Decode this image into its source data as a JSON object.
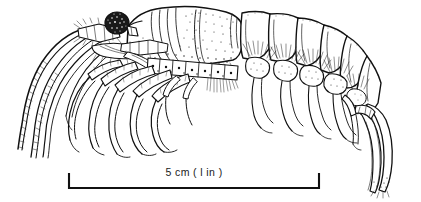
{
  "figure": {
    "background_color": "#ffffff",
    "ink_color": "#111111",
    "width": 421,
    "height": 202
  },
  "scale_bar": {
    "label": "5 cm  ( l in )",
    "metric_value": "5 cm",
    "imperial_value": "( l in )",
    "left_x": 68,
    "right_x": 320,
    "baseline_y": 188,
    "cap_height": 15,
    "color": "#111111"
  },
  "anatomy": {
    "eye": "compound-eye",
    "antennae_count": 3,
    "abdominal_segments": 6,
    "walking_legs": 5,
    "pleopods": 5,
    "tail": "telson-and-uropods"
  }
}
